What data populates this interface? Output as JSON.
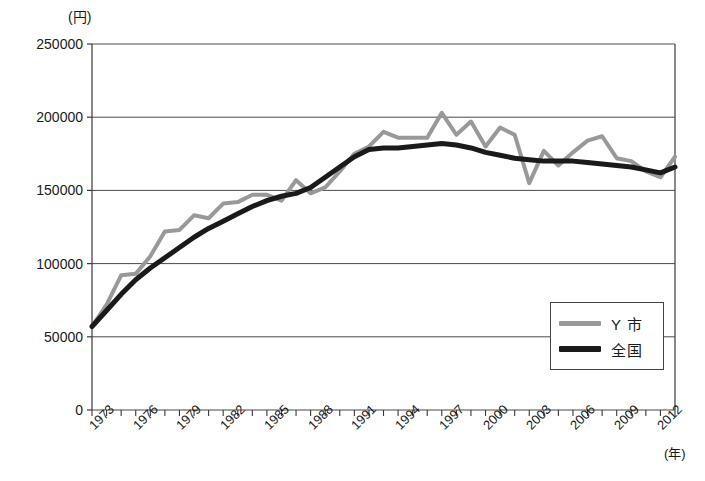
{
  "chart_data": {
    "type": "line",
    "title": "",
    "xlabel": "(年)",
    "ylabel": "(円)",
    "x": [
      1973,
      1974,
      1975,
      1976,
      1977,
      1978,
      1979,
      1980,
      1981,
      1982,
      1983,
      1984,
      1985,
      1986,
      1987,
      1988,
      1989,
      1990,
      1991,
      1992,
      1993,
      1994,
      1995,
      1996,
      1997,
      1998,
      1999,
      2000,
      2001,
      2002,
      2003,
      2004,
      2005,
      2006,
      2007,
      2008,
      2009,
      2010,
      2011,
      2012,
      2013
    ],
    "xtick_labels": [
      "1973",
      "1976",
      "1979",
      "1982",
      "1985",
      "1988",
      "1991",
      "1994",
      "1997",
      "2000",
      "2003",
      "2006",
      "2009",
      "2012"
    ],
    "xtick_values": [
      1973,
      1976,
      1979,
      1982,
      1985,
      1988,
      1991,
      1994,
      1997,
      2000,
      2003,
      2006,
      2009,
      2012
    ],
    "ytick_labels": [
      "0",
      "50000",
      "100000",
      "150000",
      "200000",
      "250000"
    ],
    "ytick_values": [
      0,
      50000,
      100000,
      150000,
      200000,
      250000
    ],
    "ylim": [
      0,
      250000
    ],
    "xlim": [
      1973,
      2013
    ],
    "grid": true,
    "legend_position": "inside-lower-right",
    "series": [
      {
        "name": "Y 市",
        "color": "#999999",
        "line_width": 4,
        "values": [
          57000,
          72000,
          92000,
          93000,
          105000,
          122000,
          123000,
          133000,
          131000,
          141000,
          142000,
          147000,
          147000,
          143000,
          157000,
          148000,
          152000,
          163000,
          175000,
          180000,
          190000,
          186000,
          186000,
          186000,
          203000,
          188000,
          197000,
          180000,
          193000,
          188000,
          155000,
          177000,
          167000,
          176000,
          184000,
          187000,
          172000,
          170000,
          163000,
          159000,
          173000
        ]
      },
      {
        "name": "全国",
        "color": "#1a1a1a",
        "line_width": 5,
        "values": [
          57000,
          68000,
          79000,
          89000,
          97000,
          104000,
          111000,
          118000,
          124000,
          129000,
          134000,
          139000,
          143000,
          146000,
          148000,
          152000,
          159000,
          166000,
          173000,
          178000,
          179000,
          179000,
          180000,
          181000,
          182000,
          181000,
          179000,
          176000,
          174000,
          172000,
          171000,
          170000,
          170000,
          170000,
          169000,
          168000,
          167000,
          166000,
          164000,
          162000,
          166000
        ]
      }
    ]
  },
  "legend": {
    "entries": [
      {
        "label": "Y 市",
        "color": "#999999"
      },
      {
        "label": "全国",
        "color": "#1a1a1a"
      }
    ]
  },
  "axes": {
    "y_unit": "(円)",
    "x_unit": "(年)"
  }
}
